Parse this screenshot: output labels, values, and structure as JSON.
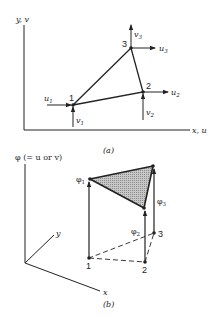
{
  "figure_a": {
    "caption": "(a)",
    "axis_y_label": "y, v",
    "axis_x_label": "x, u",
    "nodes": [
      {
        "id": "1",
        "u_label": "u",
        "u_sub": "1",
        "v_label": "v",
        "v_sub": "1"
      },
      {
        "id": "2",
        "u_label": "u",
        "u_sub": "2",
        "v_label": "v",
        "v_sub": "2"
      },
      {
        "id": "3",
        "u_label": "u",
        "u_sub": "3",
        "v_label": "v",
        "v_sub": "3"
      }
    ]
  },
  "figure_b": {
    "caption": "(b)",
    "axis_phi_label": "φ (= u or v)",
    "axis_x_label": "x",
    "axis_y_label": "y",
    "nodes": [
      {
        "id": "1",
        "phi": "φ",
        "phi_sub": "1"
      },
      {
        "id": "2",
        "phi": "φ",
        "phi_sub": "2"
      },
      {
        "id": "3",
        "phi": "φ",
        "phi_sub": "3"
      }
    ]
  },
  "colors": {
    "line": "#222222",
    "shade": "#bdbdbd"
  }
}
